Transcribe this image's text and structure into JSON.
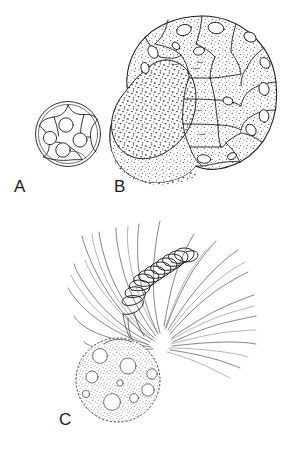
{
  "figure": {
    "kind": "scientific-line-drawing-plate",
    "background_color": "#ffffff",
    "ink_color": "#1d1d1d",
    "width": 288,
    "height": 453,
    "caption_labels": [
      "A",
      "B",
      "C"
    ],
    "panels": [
      {
        "id": "A",
        "label": "A",
        "label_x": 14,
        "label_y": 192,
        "description": "Small spherical early-stage cell with double outer wall and internal polygonal compartments containing round nuclei",
        "center_x": 68,
        "center_y": 134,
        "radius_outer": 33,
        "radius_inner": 30,
        "nuclei_count": 4,
        "compartment_count": 6,
        "texture": "none"
      },
      {
        "id": "B",
        "label": "B",
        "label_x": 114,
        "label_y": 192,
        "description": "Large reniform multicellular stage, stippled, with peripheral polygonal cells bearing oval pores and one large coarsely stippled lobe",
        "center_x": 202,
        "center_y": 103,
        "radius_x": 76,
        "radius_y": 88,
        "cell_count": 18,
        "pore_count": 14,
        "texture": "stipple"
      },
      {
        "id": "C",
        "label": "C",
        "label_x": 59,
        "label_y": 425,
        "description": "Stippled spherical body with vacuoles bearing a helical coiled appendage and a spray of fine radiating filaments",
        "sphere_center_x": 118,
        "sphere_center_y": 380,
        "sphere_radius": 42,
        "vacuole_count": 9,
        "coil_turns": 11,
        "filament_count": 26,
        "texture": "stipple"
      }
    ]
  }
}
